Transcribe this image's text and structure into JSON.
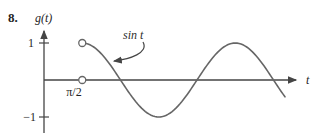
{
  "problem_number": "8.",
  "labels": {
    "y_axis": "g(t)",
    "x_axis": "t",
    "curve": "sin t",
    "x_tick_pi_over_2": "π/2",
    "y_tick_top": "1",
    "y_tick_bottom": "−1"
  },
  "colors": {
    "axis": "#454545",
    "curve": "#666666",
    "text": "#1f1f1f",
    "background": "#ffffff"
  },
  "chart_data": {
    "type": "line",
    "title": "",
    "xlabel": "t",
    "ylabel": "g(t)",
    "function": "g(t) = sin t for t > π/2",
    "domain_start_pi": 0.5,
    "domain_end_pi": 3.15,
    "ylim": [
      -1,
      1
    ],
    "x_ticks": [
      "π/2"
    ],
    "y_ticks": [
      1,
      -1
    ],
    "open_points": [
      {
        "t_pi": 0.5,
        "y": 1
      },
      {
        "t_pi": 0.5,
        "y": 0
      }
    ],
    "samples_t_over_pi": [
      0.5,
      0.75,
      1.0,
      1.25,
      1.5,
      1.75,
      2.0,
      2.25,
      2.5,
      2.75,
      3.0,
      3.15
    ],
    "samples_y": [
      1.0,
      0.707,
      0.0,
      -0.707,
      -1.0,
      -0.707,
      0.0,
      0.707,
      1.0,
      0.707,
      0.0,
      -0.454
    ],
    "grid": false,
    "legend": false
  }
}
